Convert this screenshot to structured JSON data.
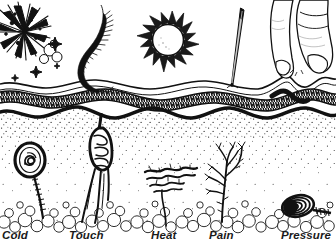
{
  "figure": {
    "background_color": "#ffffff",
    "ink_color": "#111111",
    "width": 336,
    "height": 245
  },
  "labels": [
    {
      "id": "cold",
      "text": "Cold"
    },
    {
      "id": "touch",
      "text": "Touch"
    },
    {
      "id": "heat",
      "text": "Heat"
    },
    {
      "id": "pain",
      "text": "Pain"
    },
    {
      "id": "pressure",
      "text": "Pressure"
    }
  ],
  "stimuli": [
    {
      "id": "cold",
      "icon": "frost-burst-icon",
      "name": "Ice crystal burst"
    },
    {
      "id": "touch",
      "icon": "feather-icon",
      "name": "Feather"
    },
    {
      "id": "heat",
      "icon": "sun-icon",
      "name": "Sun"
    },
    {
      "id": "pain",
      "icon": "needle-icon",
      "name": "Needle"
    },
    {
      "id": "pressure",
      "icon": "fingers-icon",
      "name": "Pressing fingers"
    }
  ],
  "receptors": [
    {
      "id": "cold",
      "icon": "krause-end-bulb-icon",
      "name": "Krause end bulb"
    },
    {
      "id": "touch",
      "icon": "meissner-corpuscle-icon",
      "name": "Meissner corpuscle"
    },
    {
      "id": "heat",
      "icon": "ruffini-ending-icon",
      "name": "Ruffini ending"
    },
    {
      "id": "pain",
      "icon": "free-nerve-ending-icon",
      "name": "Free nerve endings"
    },
    {
      "id": "pressure",
      "icon": "pacinian-corpuscle-icon",
      "name": "Pacinian corpuscle"
    }
  ],
  "skin_layers": [
    {
      "id": "epidermis",
      "name": "Epidermis surface line"
    },
    {
      "id": "dermal-band",
      "name": "Textured dermal band"
    },
    {
      "id": "dermis-base",
      "name": "Thick wavy dermis boundary"
    },
    {
      "id": "dermis-fill",
      "name": "Stippled dermis"
    },
    {
      "id": "fat-layer",
      "name": "Subcutaneous fat cells"
    }
  ]
}
